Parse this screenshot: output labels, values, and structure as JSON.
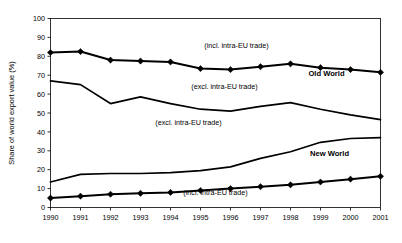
{
  "chart_data": {
    "type": "line",
    "title": "",
    "xlabel": "",
    "ylabel": "Share of world export value (%)",
    "ylim": [
      0,
      100
    ],
    "ytick_step": 10,
    "grid": false,
    "legend_position": "inline-annotations",
    "categories": [
      "1990",
      "1991",
      "1992",
      "1993",
      "1994",
      "1995",
      "1996",
      "1997",
      "1998",
      "1999",
      "2000",
      "2001"
    ],
    "x": [
      1990,
      1991,
      1992,
      1993,
      1994,
      1995,
      1996,
      1997,
      1998,
      1999,
      2000,
      2001
    ],
    "yticks": [
      "0",
      "10",
      "20",
      "30",
      "40",
      "50",
      "60",
      "70",
      "80",
      "90",
      "100"
    ],
    "series": [
      {
        "name": "Old World (incl. intra-EU trade)",
        "group": "Old World",
        "measure": "incl. intra-EU trade",
        "markers": true,
        "values": [
          82,
          82.5,
          78,
          77.5,
          77,
          73.5,
          73,
          74.5,
          76,
          74,
          73,
          71.5
        ]
      },
      {
        "name": "Old World (excl. intra-EU trade)",
        "group": "Old World",
        "measure": "excl. intra-EU trade",
        "markers": false,
        "values": [
          67,
          65,
          55,
          58.5,
          55,
          52,
          51,
          53.5,
          55.5,
          52,
          49,
          46.5
        ]
      },
      {
        "name": "New World (excl. intra-EU trade)",
        "group": "New World",
        "measure": "excl. intra-EU trade",
        "markers": false,
        "values": [
          13.5,
          17.5,
          18,
          18,
          18.5,
          19.5,
          21.5,
          26,
          29.5,
          34.5,
          36.5,
          37
        ]
      },
      {
        "name": "New World (incl. intra-EU trade)",
        "group": "New World",
        "measure": "incl. intra-EU trade",
        "markers": true,
        "values": [
          5,
          6,
          7,
          7.5,
          8,
          9,
          10,
          11,
          12,
          13.5,
          15,
          16.5
        ]
      }
    ],
    "annotations": [
      {
        "id": "old-incl",
        "text": "(incl. intra-EU trade)",
        "x": 1996.2,
        "y": 84.5,
        "bold": false
      },
      {
        "id": "old-world",
        "text": "Old World",
        "x": 1999.2,
        "y": 69.5,
        "bold": true
      },
      {
        "id": "old-excl",
        "text": "(excl. intra-EU trade)",
        "x": 1995.8,
        "y": 62.5,
        "bold": false
      },
      {
        "id": "new-excl",
        "text": "(excl. intra-EU trade)",
        "x": 1994.6,
        "y": 43.5,
        "bold": false
      },
      {
        "id": "new-world",
        "text": "New World",
        "x": 1999.3,
        "y": 27.5,
        "bold": true
      },
      {
        "id": "new-incl",
        "text": "(incl. intra-EU trade)",
        "x": 1995.5,
        "y": 6.5,
        "bold": false
      }
    ],
    "colors": {
      "line": "#000000",
      "axis": "#000000",
      "background": "#ffffff"
    }
  }
}
